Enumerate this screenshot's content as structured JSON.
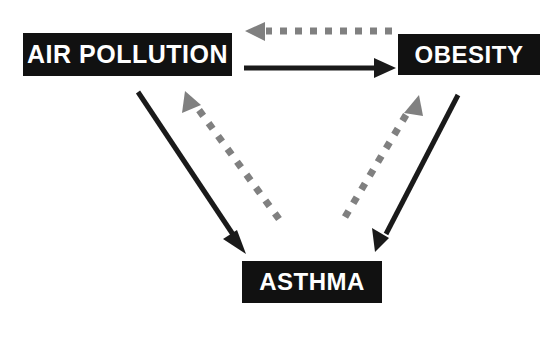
{
  "diagram": {
    "background_color": "#ffffff",
    "node_fill_color": "#111111",
    "node_text_color": "#ffffff",
    "solid_arrow_color": "#1a1a1a",
    "dotted_arrow_color": "#808080",
    "nodes": [
      {
        "id": "air-pollution",
        "label": "AIR POLLUTION"
      },
      {
        "id": "obesity",
        "label": "OBESITY"
      },
      {
        "id": "asthma",
        "label": "ASTHMA"
      }
    ],
    "edges": [
      {
        "id": "air-pollution-to-obesity",
        "from": "AIR POLLUTION",
        "to": "OBESITY",
        "style": "solid",
        "direction": "right",
        "color": "#1a1a1a"
      },
      {
        "id": "obesity-to-air-pollution",
        "from": "OBESITY",
        "to": "AIR POLLUTION",
        "style": "dotted",
        "direction": "left",
        "color": "#808080"
      },
      {
        "id": "air-pollution-to-asthma",
        "from": "AIR POLLUTION",
        "to": "ASTHMA",
        "style": "solid",
        "direction": "down-right",
        "color": "#1a1a1a"
      },
      {
        "id": "asthma-to-air-pollution",
        "from": "ASTHMA",
        "to": "AIR POLLUTION",
        "style": "dotted",
        "direction": "up-left",
        "color": "#808080"
      },
      {
        "id": "obesity-to-asthma",
        "from": "OBESITY",
        "to": "ASTHMA",
        "style": "solid",
        "direction": "down-left",
        "color": "#1a1a1a"
      },
      {
        "id": "asthma-to-obesity",
        "from": "ASTHMA",
        "to": "OBESITY",
        "style": "dotted",
        "direction": "up-right",
        "color": "#808080"
      }
    ]
  }
}
